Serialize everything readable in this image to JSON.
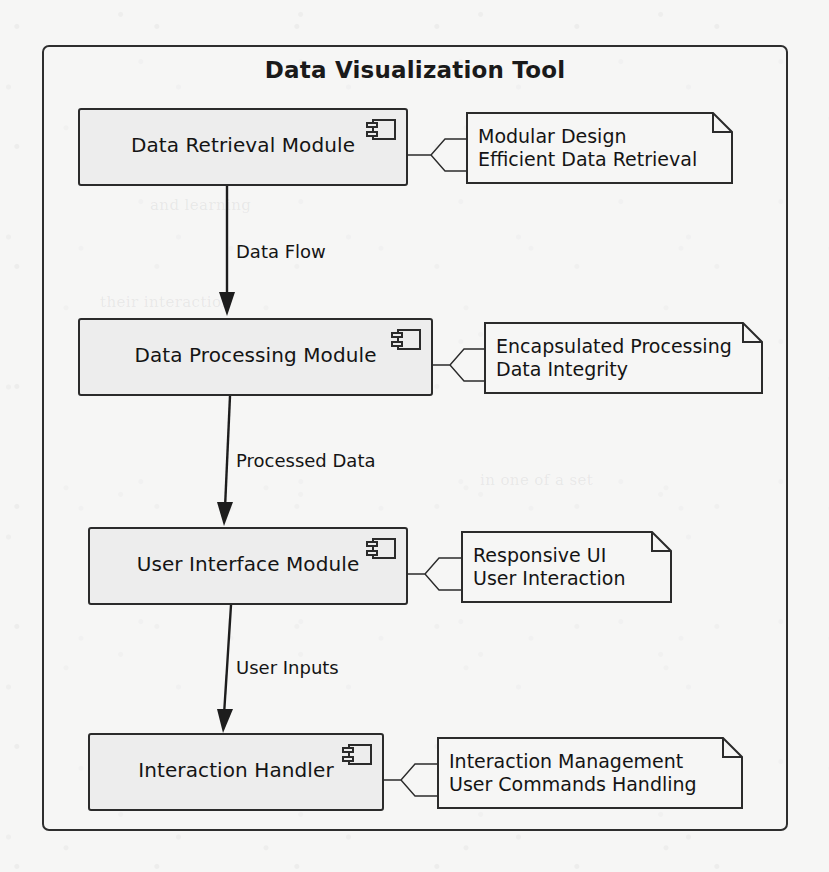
{
  "diagram": {
    "type": "uml-component-diagram",
    "system_title": "Data Visualization Tool",
    "background_color": "#f6f6f5",
    "line_color": "#2b2b2b",
    "component_fill": "#ededed",
    "components": [
      {
        "id": "data-retrieval-module",
        "label": "Data Retrieval Module",
        "icon": "component-icon",
        "note": {
          "id": "note-data-retrieval",
          "lines": [
            "Modular Design",
            "Efficient Data Retrieval"
          ]
        }
      },
      {
        "id": "data-processing-module",
        "label": "Data Processing Module",
        "icon": "component-icon",
        "note": {
          "id": "note-data-processing",
          "lines": [
            "Encapsulated Processing",
            "Data Integrity"
          ]
        }
      },
      {
        "id": "user-interface-module",
        "label": "User Interface Module",
        "icon": "component-icon",
        "note": {
          "id": "note-user-interface",
          "lines": [
            "Responsive UI",
            "User Interaction"
          ]
        }
      },
      {
        "id": "interaction-handler",
        "label": "Interaction Handler",
        "icon": "component-icon",
        "note": {
          "id": "note-interaction-handler",
          "lines": [
            "Interaction Management",
            "User Commands Handling"
          ]
        }
      }
    ],
    "flows": [
      {
        "id": "flow-data-flow",
        "label": "Data Flow",
        "from": "data-retrieval-module",
        "to": "data-processing-module"
      },
      {
        "id": "flow-processed-data",
        "label": "Processed Data",
        "from": "data-processing-module",
        "to": "user-interface-module"
      },
      {
        "id": "flow-user-inputs",
        "label": "User Inputs",
        "from": "user-interface-module",
        "to": "interaction-handler"
      }
    ],
    "background_bleed_text": [
      "and learning",
      "their interaction",
      "in one of a set"
    ]
  }
}
